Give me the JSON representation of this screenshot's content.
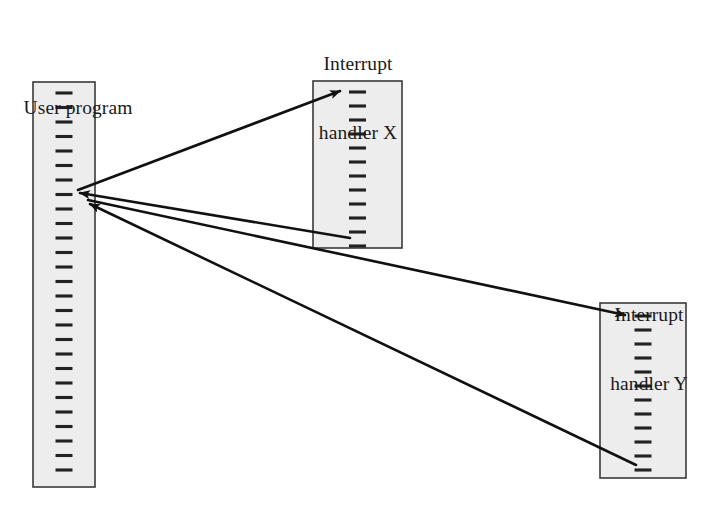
{
  "diagram": {
    "type": "interrupt-handling-control-flow",
    "canvas": {
      "width": 714,
      "height": 511,
      "background": "#ffffff"
    },
    "style": {
      "box_fill": "#ededed",
      "box_stroke": "#3a3a3a",
      "tick_color": "#222222",
      "line_color": "#111111"
    },
    "labels": {
      "user_program": {
        "line1": "User program"
      },
      "handler_x": {
        "line1": "Interrupt",
        "line2": "handler X"
      },
      "handler_y": {
        "line1": "Interrupt",
        "line2": "handler Y"
      }
    },
    "boxes": [
      {
        "id": "user-program",
        "name": "User program",
        "x": 33,
        "y": 82,
        "width": 62,
        "height": 405,
        "tick_count": 27,
        "tick_width": 17,
        "tick_first_y": 93,
        "tick_pitch": 14.5
      },
      {
        "id": "interrupt-handler-x",
        "name": "Interrupt handler X",
        "x": 313,
        "y": 81,
        "width": 89,
        "height": 167,
        "tick_count": 12,
        "tick_width": 17,
        "tick_first_y": 92,
        "tick_pitch": 14.0
      },
      {
        "id": "interrupt-handler-y",
        "name": "Interrupt handler Y",
        "x": 600,
        "y": 303,
        "width": 86,
        "height": 175,
        "tick_count": 12,
        "tick_width": 17,
        "tick_first_y": 316,
        "tick_pitch": 14.0
      }
    ],
    "arrows": [
      {
        "id": "call-x",
        "from": "user-program",
        "to": "interrupt-handler-x",
        "x1": 78,
        "y1": 190,
        "x2": 340,
        "y2": 91,
        "arrowhead": "end"
      },
      {
        "id": "return-x",
        "from": "interrupt-handler-x",
        "to": "user-program",
        "x1": 350,
        "y1": 238,
        "x2": 80,
        "y2": 193,
        "arrowhead": "end"
      },
      {
        "id": "call-y",
        "from": "user-program",
        "to": "interrupt-handler-y",
        "x1": 88,
        "y1": 200,
        "x2": 625,
        "y2": 315,
        "arrowhead": "end"
      },
      {
        "id": "return-y",
        "from": "interrupt-handler-y",
        "to": "user-program",
        "x1": 636,
        "y1": 465,
        "x2": 90,
        "y2": 204,
        "arrowhead": "end"
      }
    ]
  }
}
